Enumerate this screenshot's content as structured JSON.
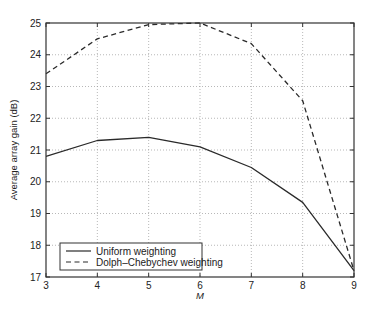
{
  "chart_data": {
    "type": "line",
    "title": "",
    "xlabel": "M",
    "ylabel": "Average array gain (dB)",
    "x": [
      3,
      4,
      5,
      6,
      7,
      8,
      9
    ],
    "xlim": [
      3,
      9
    ],
    "ylim": [
      17,
      25
    ],
    "xticks": [
      3,
      4,
      5,
      6,
      7,
      8,
      9
    ],
    "yticks": [
      17,
      18,
      19,
      20,
      21,
      22,
      23,
      24,
      25
    ],
    "grid": true,
    "legend_position": "lower left",
    "series": [
      {
        "name": "Uniform weighting",
        "style": "solid",
        "values": [
          20.8,
          21.3,
          21.4,
          21.1,
          20.45,
          19.35,
          17.2
        ]
      },
      {
        "name": "Dolph–Chebychev weighting",
        "style": "dashed",
        "values": [
          23.4,
          24.5,
          24.95,
          25.0,
          24.35,
          22.55,
          17.2
        ]
      }
    ]
  },
  "colors": {
    "line": "#2a2a2a",
    "grid": "#9a9a9a",
    "axis": "#333333"
  }
}
